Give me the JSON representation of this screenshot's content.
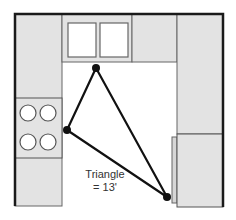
{
  "diagram": {
    "type": "kitchen-floor-plan",
    "label": {
      "line1": "Triangle",
      "line2": "= 13'"
    },
    "colors": {
      "cabinet_fill": "#e3e3e3",
      "outline": "#555555",
      "wall": "#1a1a1a",
      "triangle": "#111111",
      "background": "#ffffff"
    },
    "elements": [
      {
        "name": "left-counter",
        "kind": "cabinet"
      },
      {
        "name": "stove",
        "kind": "appliance",
        "burners": 4
      },
      {
        "name": "sink-counter",
        "kind": "cabinet",
        "windows": 2
      },
      {
        "name": "top-right-counter",
        "kind": "cabinet"
      },
      {
        "name": "right-counter",
        "kind": "cabinet"
      },
      {
        "name": "refrigerator",
        "kind": "appliance"
      }
    ],
    "triangle_vertices": [
      {
        "name": "sink-vertex",
        "x": 96,
        "y": 68
      },
      {
        "name": "stove-vertex",
        "x": 67,
        "y": 130
      },
      {
        "name": "fridge-vertex",
        "x": 167,
        "y": 197
      }
    ]
  }
}
